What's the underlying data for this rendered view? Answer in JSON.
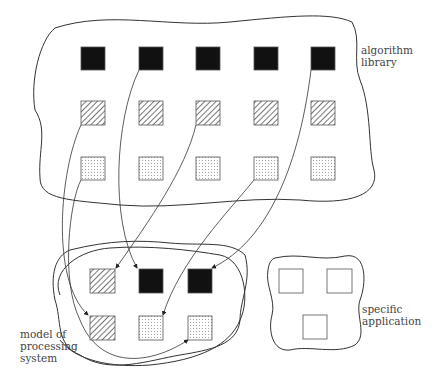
{
  "labels": {
    "library_line1": "algorithm",
    "library_line2": "library",
    "model_line1": "model of",
    "model_line2": "processing",
    "model_line3": "system",
    "app_line1": "specific",
    "app_line2": "application"
  },
  "library": {
    "rows": [
      {
        "pattern": "solid",
        "y": 47
      },
      {
        "pattern": "hatched",
        "y": 101
      },
      {
        "pattern": "dotted",
        "y": 157
      }
    ],
    "columns_x": [
      81,
      139,
      196,
      254,
      311
    ],
    "square_size": 24
  },
  "model": {
    "squares": [
      {
        "pattern": "hatched",
        "x": 90,
        "y": 269
      },
      {
        "pattern": "solid",
        "x": 139,
        "y": 269
      },
      {
        "pattern": "solid",
        "x": 188,
        "y": 269
      },
      {
        "pattern": "hatched",
        "x": 90,
        "y": 316
      },
      {
        "pattern": "dotted",
        "x": 139,
        "y": 316
      },
      {
        "pattern": "dotted",
        "x": 188,
        "y": 316
      }
    ]
  },
  "application": {
    "squares": [
      {
        "pattern": "empty",
        "x": 279,
        "y": 269
      },
      {
        "pattern": "empty",
        "x": 327,
        "y": 269
      },
      {
        "pattern": "empty",
        "x": 303,
        "y": 315
      }
    ]
  },
  "colors": {
    "ink": "#111111",
    "line": "#333333"
  }
}
